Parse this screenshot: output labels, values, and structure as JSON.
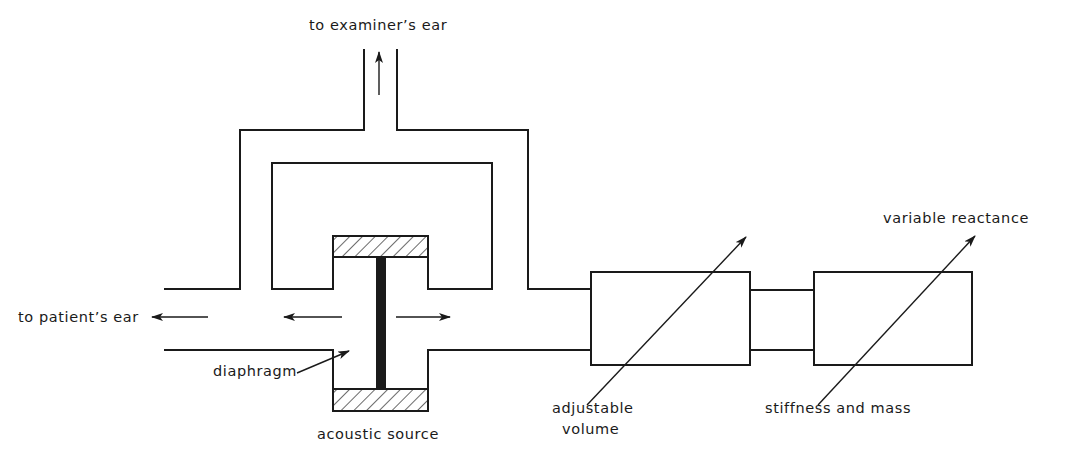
{
  "diagram": {
    "type": "acoustic-bridge-schematic",
    "colors": {
      "ink": "#1a1a1a",
      "background": "#ffffff"
    },
    "labels": {
      "examiner_ear": "to examiner’s ear",
      "patient_ear": "to patient’s ear",
      "diaphragm": "diaphragm",
      "acoustic_source": "acoustic source",
      "adjustable_volume_line1": "adjustable",
      "adjustable_volume_line2": "volume",
      "stiffness_and_mass": "stiffness and mass",
      "variable_reactance": "variable reactance"
    },
    "components": [
      {
        "id": "examiner-tube",
        "kind": "tube",
        "direction": "up"
      },
      {
        "id": "bridge-loop",
        "kind": "tube-loop"
      },
      {
        "id": "acoustic-source",
        "kind": "diaphragm-driver",
        "hatched_ends": 2
      },
      {
        "id": "patient-tube",
        "kind": "tube",
        "direction": "left"
      },
      {
        "id": "adjustable-volume",
        "kind": "variable-box"
      },
      {
        "id": "stiffness-and-mass",
        "kind": "variable-box"
      }
    ],
    "flow_arrows": [
      "up-to-examiner",
      "left-to-patient",
      "left-from-source",
      "right-from-source"
    ]
  }
}
